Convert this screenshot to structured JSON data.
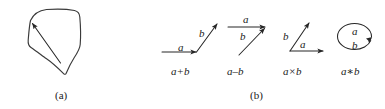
{
  "figure": {
    "background_color": "#ffffff",
    "ink_color": "#262626",
    "panels": [
      {
        "id": "panel-a",
        "caption": "(a)",
        "caption_x": 55,
        "caption_y": 90,
        "description": "closed irregular pentagon outline with a single arrow inside pointing up-left",
        "shape": {
          "name": "irregular-pentagon",
          "points": "30,20 46,9 74,10 80,44 66,73 46,59 28,45"
        },
        "arrow": {
          "name": "interior-arrow",
          "from_x": 60,
          "from_y": 63,
          "to_x": 31,
          "to_y": 22
        }
      },
      {
        "id": "panel-b",
        "caption": "(b)",
        "caption_x": 250,
        "caption_y": 90,
        "diagrams": [
          {
            "id": "diagram-sum",
            "op_label": "a+b",
            "op_x": 171,
            "op_y": 66,
            "vectors": [
              {
                "name": "vector-a",
                "label": "a",
                "label_x": 178,
                "label_y": 42
              },
              {
                "name": "vector-b",
                "label": "b",
                "label_x": 199,
                "label_y": 28
              }
            ]
          },
          {
            "id": "diagram-difference",
            "op_label": "a–b",
            "op_x": 227,
            "op_y": 66,
            "vectors": [
              {
                "name": "vector-a",
                "label": "a",
                "label_x": 243,
                "label_y": 16
              },
              {
                "name": "vector-b",
                "label": "b",
                "label_x": 240,
                "label_y": 33
              }
            ]
          },
          {
            "id": "diagram-cross",
            "op_label": "a×b",
            "op_x": 283,
            "op_y": 66,
            "vectors": [
              {
                "name": "vector-b",
                "label": "b",
                "label_x": 283,
                "label_y": 33
              },
              {
                "name": "vector-a",
                "label": "a",
                "label_x": 299,
                "label_y": 41
              }
            ]
          },
          {
            "id": "diagram-star",
            "op_label": "a∗b",
            "op_x": 341,
            "op_y": 66,
            "vectors": [
              {
                "name": "loop-label-a",
                "label": "a",
                "label_x": 353,
                "label_y": 26
              },
              {
                "name": "loop-label-b",
                "label": "b",
                "label_x": 353,
                "label_y": 41
              }
            ]
          }
        ]
      }
    ]
  }
}
